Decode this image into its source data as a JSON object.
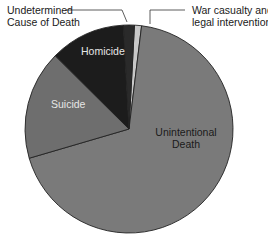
{
  "chart_data": {
    "type": "pie",
    "title": "",
    "start_angle_deg": 0,
    "direction": "clockwise",
    "slices": [
      {
        "name": "War casualty and legal intervention",
        "value": 1.1,
        "color": "#c8c8c8",
        "label_position": "outside"
      },
      {
        "name": "Unintentional Death",
        "value": 68.6,
        "color": "#7a7a7a",
        "label_position": "inside"
      },
      {
        "name": "Suicide",
        "value": 17.0,
        "color": "#6e6e6e",
        "label_position": "inside"
      },
      {
        "name": "Homicide",
        "value": 11.7,
        "color": "#1c1c1c",
        "label_position": "inside"
      },
      {
        "name": "Undetermined Cause of Death",
        "value": 1.7,
        "color": "#2a2a2a",
        "label_position": "outside"
      }
    ],
    "legend": "none",
    "units": "percent (estimated from slice angles)"
  },
  "labels": {
    "undetermined_line1": "Undetermined",
    "undetermined_line2": "Cause of Death",
    "war_line1": "War casualty and",
    "war_line2": "legal intervention",
    "homicide": "Homicide",
    "suicide": "Suicide",
    "unintentional_line1": "Unintentional",
    "unintentional_line2": "Death"
  },
  "colors": {
    "outline": "#222222",
    "inside_label_light": "#e6e6e6",
    "inside_label_dark": "#1a1a1a",
    "leader_line": "#333333"
  }
}
